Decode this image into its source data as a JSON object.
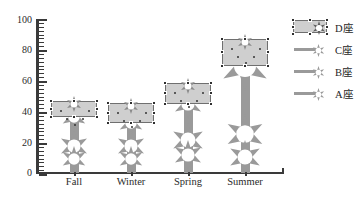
{
  "chart_data": {
    "type": "line",
    "title": "",
    "xlabel": "",
    "ylabel": "",
    "categories": [
      "Fall",
      "Winter",
      "Spring",
      "Summer"
    ],
    "ylim": [
      0,
      100
    ],
    "yticks": [
      0,
      20,
      40,
      60,
      80,
      100
    ],
    "minor_tick_step": 2.5,
    "grid": false,
    "legend_position": "right",
    "series": [
      {
        "name": "D座",
        "values": [
          45,
          44,
          57,
          85
        ],
        "marker": "star",
        "selected": true,
        "fill": true
      },
      {
        "name": "C座",
        "values": [
          37,
          33,
          45,
          70
        ],
        "marker": "star",
        "selected": false,
        "fill": false
      },
      {
        "name": "B座",
        "values": [
          18,
          18,
          22,
          26
        ],
        "marker": "star",
        "selected": false,
        "fill": false
      },
      {
        "name": "A座",
        "values": [
          10,
          10,
          12,
          11
        ],
        "marker": "star",
        "selected": false,
        "fill": false
      }
    ]
  },
  "axes": {
    "y_tick_labels": [
      "100",
      "80",
      "60",
      "40",
      "20",
      "0"
    ],
    "x_tick_labels": [
      "Fall",
      "Winter",
      "Spring",
      "Summer"
    ]
  },
  "legend": {
    "items": [
      {
        "label": "D座",
        "swatch": "filled-band-with-star",
        "selected": true
      },
      {
        "label": "C座",
        "swatch": "line-with-star",
        "selected": false
      },
      {
        "label": "B座",
        "swatch": "line-with-star",
        "selected": false
      },
      {
        "label": "A座",
        "swatch": "line-with-star",
        "selected": false
      }
    ]
  },
  "colors": {
    "marker_gray": "#9a9a9a",
    "band_fill": "#cfcfcf",
    "band_stroke": "#6f6f6f",
    "axis": "#3a3a3a",
    "text": "#1e1e1e",
    "background": "#ffffff",
    "handle": "#2f2f2f"
  }
}
